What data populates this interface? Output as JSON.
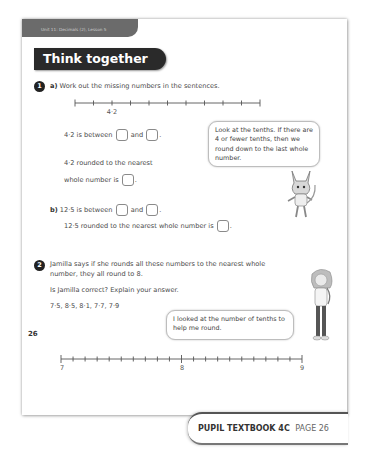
{
  "header": {
    "unit_label": "Unit 11: Decimals (2), Lesson 5",
    "section_title": "Think together"
  },
  "question1": {
    "number": "1",
    "part_a": {
      "label": "a)",
      "instruction": "Work out the missing numbers in the sentences.",
      "number_line": {
        "ticks": 11,
        "marked_tick_index": 2,
        "marked_label": "4·2"
      },
      "sentence1_prefix": "4·2 is between",
      "sentence1_mid": "and",
      "sentence1_suffix": ".",
      "sentence2_line1": "4·2 rounded to the nearest",
      "sentence2_line2": "whole number is",
      "sentence2_suffix": "."
    },
    "hint_bubble": "Look at the tenths. If there are 4 or fewer tenths, then we round down to the last whole number.",
    "part_b": {
      "label": "b)",
      "sentence1_prefix": "12·5 is between",
      "sentence1_mid": "and",
      "sentence1_suffix": ".",
      "sentence2": "12·5 rounded to the nearest whole number is",
      "sentence2_suffix": "."
    }
  },
  "question2": {
    "number": "2",
    "line1": "Jamilla says if she rounds all these numbers to the nearest whole",
    "line2": "number, they all round to 8.",
    "prompt": "Is Jamilla correct? Explain your answer.",
    "numbers": "7·5,  8·5,  8·1,  7·7,  7·9",
    "bubble": "I looked at the number of tenths to help me round.",
    "number_line": {
      "start_label": "7",
      "mid_label": "8",
      "end_label": "9",
      "intervals": 20
    }
  },
  "page_number": "26",
  "footer": {
    "book": "PUPIL TEXTBOOK 4C",
    "page": "PAGE 26"
  }
}
